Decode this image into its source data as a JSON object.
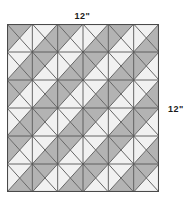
{
  "diagram": {
    "labels": {
      "top_dimension": "12\"",
      "right_dimension": "12\"",
      "top_artifact": ""
    },
    "grid": {
      "rows": 6,
      "cols": 6,
      "cell_width": 25.333,
      "cell_height": 28.0,
      "x_origin": 0,
      "y_origin": 0,
      "width": 152,
      "height": 168
    },
    "colors": {
      "light_patch": "#f1f1f1",
      "dark_patch": "#b3b3b3",
      "diagonal_line": "#666666",
      "grid_line": "#555555",
      "outline": "#4a4a4a",
      "background": "#ffffff",
      "label_text": "#1a1a1a"
    },
    "pattern": {
      "description": "Each square cell is split by both diagonals into four triangles (top, right, bottom, left). Shading alternates to form pinwheel / hourglass motifs across a 6 by 6 block.",
      "triangle_order": [
        "top",
        "right",
        "bottom",
        "left"
      ],
      "cells": [
        [
          "DLLD",
          "LDDL",
          "DLLD",
          "LDDL",
          "DLLD",
          "LDDL"
        ],
        [
          "LDDL",
          "DLLD",
          "LDDL",
          "DLLD",
          "LDDL",
          "DLLD"
        ],
        [
          "DLLD",
          "LDDL",
          "DLLD",
          "LDDL",
          "DLLD",
          "LDDL"
        ],
        [
          "LDDL",
          "DLLD",
          "LDDL",
          "DLLD",
          "LDDL",
          "DLLD"
        ],
        [
          "DLLD",
          "LDDL",
          "DLLD",
          "LDDL",
          "DLLD",
          "LDDL"
        ],
        [
          "LDDL",
          "DLLD",
          "LDDL",
          "DLLD",
          "LDDL",
          "DLLD"
        ]
      ]
    },
    "line_widths": {
      "diagonal": 1.0,
      "grid": 0.9,
      "outline": 1.1
    }
  }
}
